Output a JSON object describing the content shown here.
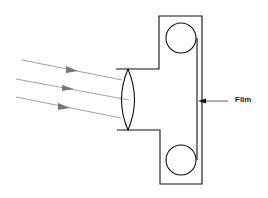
{
  "diagram": {
    "type": "camera-optics-schematic",
    "labels": {
      "film": "Film"
    },
    "components": [
      {
        "name": "light-rays",
        "count": 3
      },
      {
        "name": "convex-lens"
      },
      {
        "name": "camera-body"
      },
      {
        "name": "film-supply-spool"
      },
      {
        "name": "film-takeup-spool"
      },
      {
        "name": "film-strip"
      }
    ],
    "colors": {
      "line": "#111111",
      "ray": "#888888",
      "ray_arrow": "#777777",
      "background": "#ffffff"
    }
  }
}
